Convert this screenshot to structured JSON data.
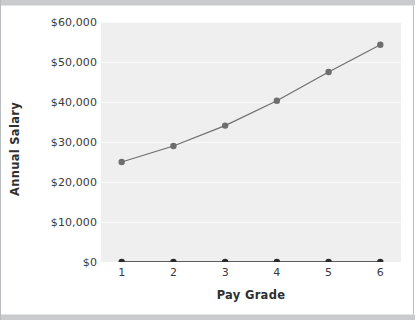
{
  "chart_data": {
    "type": "line",
    "title": "",
    "xlabel": "Pay Grade",
    "ylabel": "Annual Salary",
    "x": [
      1,
      2,
      3,
      4,
      5,
      6
    ],
    "categories": [
      "1",
      "2",
      "3",
      "4",
      "5",
      "6"
    ],
    "xlim": [
      0.6,
      6.4
    ],
    "ylim": [
      0,
      60000
    ],
    "grid": true,
    "legend": "none",
    "y_tick_labels": [
      "$60,000",
      "$50,000",
      "$40,000",
      "$30,000",
      "$20,000",
      "$10,000",
      "$0"
    ],
    "y_tick_values": [
      60000,
      50000,
      40000,
      30000,
      20000,
      10000,
      0
    ],
    "x_tick_labels": [
      "1",
      "2",
      "3",
      "4",
      "5",
      "6"
    ],
    "series": [
      {
        "name": "Annual Salary",
        "values": [
          25000,
          29000,
          34100,
          40300,
          47500,
          54300
        ],
        "color": "#6e6e6e",
        "marker": "circle"
      },
      {
        "name": "Baseline",
        "values": [
          0,
          0,
          0,
          0,
          0,
          0
        ],
        "color": "#2b2b2b",
        "marker": "circle"
      }
    ]
  },
  "figure": {
    "background": "#ffffff",
    "plot_background": "#efefef",
    "border_color": "#b9bcbe",
    "edge_strip_color": "#c9cbcd",
    "gridline_color": "#fbfbfb",
    "tick_label_color": "#3b3b3b",
    "axis_title_color": "#2f2f2f"
  }
}
